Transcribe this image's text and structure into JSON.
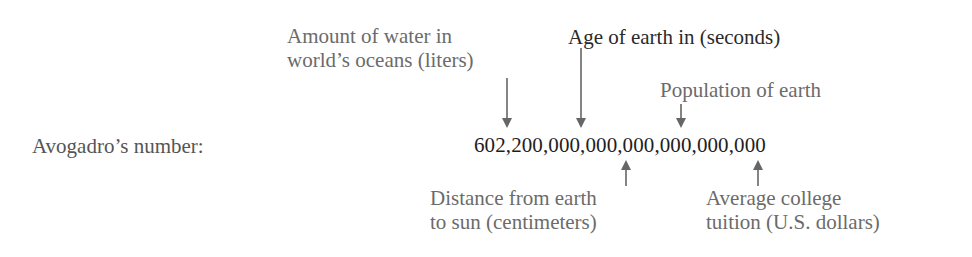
{
  "row_label": "Avogadro’s number:",
  "number": "602,200,000,000,000,000,000,000",
  "annotations_above": [
    {
      "line1": "Amount of water in",
      "line2": "world’s oceans (liters)"
    },
    {
      "line1": "Age of earth in (seconds)"
    },
    {
      "line1": "Population of earth"
    }
  ],
  "annotations_below": [
    {
      "line1": "Distance from earth",
      "line2": "to sun (centimeters)"
    },
    {
      "line1": "Average college",
      "line2": "tuition (U.S. dollars)"
    }
  ],
  "colors": {
    "text": "#1e1e1e",
    "label": "#6b6b6b",
    "arrow": "#666666"
  }
}
